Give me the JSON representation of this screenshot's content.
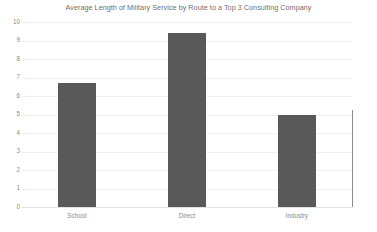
{
  "chart_data": {
    "type": "bar",
    "title": "Average Length of Military Service by Route to a Top 3 Consulting Company",
    "categories": [
      "School",
      "Direct",
      "Industry"
    ],
    "values": [
      6.7,
      9.4,
      5.0
    ],
    "xlabel": "",
    "ylabel": "",
    "ylim": [
      0,
      10
    ],
    "ytick_labels": [
      "10",
      "9",
      "8",
      "7",
      "6",
      "5",
      "4",
      "3",
      "2",
      "1",
      "0"
    ],
    "ytick_values": [
      10,
      9,
      8,
      7,
      6,
      5,
      4,
      3,
      2,
      1,
      0
    ],
    "grid": true,
    "legend": "none",
    "bar_color": "#595959",
    "grid_color": "#efefef",
    "background_color": "#ffffff",
    "text_color": "#8a8a8a"
  }
}
